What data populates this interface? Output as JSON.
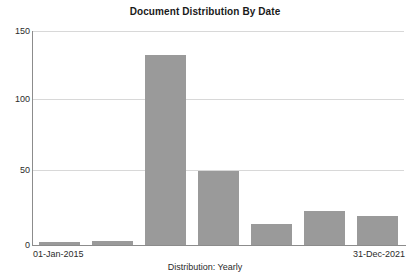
{
  "chart_data": {
    "type": "bar",
    "title": "Document Distribution By Date",
    "xlabel": "Distribution: Yearly",
    "ylabel": "",
    "categories": [
      "2015",
      "2016",
      "2017",
      "2018",
      "2019",
      "2020",
      "2021"
    ],
    "values": [
      2,
      3,
      133,
      52,
      15,
      24,
      20
    ],
    "ylim": [
      0,
      150
    ],
    "yticks": [
      0,
      50,
      100,
      150
    ],
    "ytick_labels": [
      "0",
      "50",
      "100",
      "150"
    ],
    "xtick_labels": [
      "01-Jan-2015",
      "31-Dec-2021"
    ],
    "x_range_start": "01-Jan-2015",
    "x_range_end": "31-Dec-2021",
    "grid": true,
    "grid_axis": "y",
    "legend": false,
    "bar_color": "#9a9a9a",
    "grid_color": "#d8d8d8",
    "axis_color": "#8c8c8c",
    "text_color": "#2b2b2b",
    "background": "#ffffff"
  }
}
